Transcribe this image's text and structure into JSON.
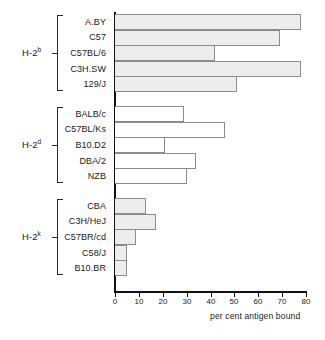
{
  "figure": {
    "axis_title": "per cent antigen bound"
  },
  "chart_data": {
    "type": "bar",
    "orientation": "horizontal",
    "title": "",
    "xlabel": "per cent antigen bound",
    "ylabel": "",
    "xlim": [
      0,
      80
    ],
    "xticks": [
      0,
      10,
      20,
      30,
      40,
      50,
      60,
      70,
      80
    ],
    "xtick_labels": [
      "0",
      "10",
      "20",
      "30",
      "40",
      "50",
      "60",
      "70",
      "80"
    ],
    "grid": false,
    "legend": "none",
    "groups": [
      {
        "haplotype": "H-2",
        "haplotype_superscript": "b",
        "fill": "shaded",
        "fill_color": "#ededed",
        "categories": [
          "A.BY",
          "C57",
          "C57BL/6",
          "C3H.SW",
          "129/J"
        ],
        "values": [
          78,
          69,
          42,
          78,
          51
        ]
      },
      {
        "haplotype": "H-2",
        "haplotype_superscript": "d",
        "fill": "hollow",
        "fill_color": "#ffffff",
        "categories": [
          "BALB/c",
          "C57BL/Ks",
          "B10.D2",
          "DBA/2",
          "NZB"
        ],
        "values": [
          29,
          46,
          21,
          34,
          30
        ]
      },
      {
        "haplotype": "H-2",
        "haplotype_superscript": "k",
        "fill": "shaded",
        "fill_color": "#ededed",
        "categories": [
          "CBA",
          "C3H/HeJ",
          "C57BR/cd",
          "C58/J",
          "B10.BR"
        ],
        "values": [
          13,
          17,
          9,
          5,
          5
        ]
      }
    ]
  }
}
